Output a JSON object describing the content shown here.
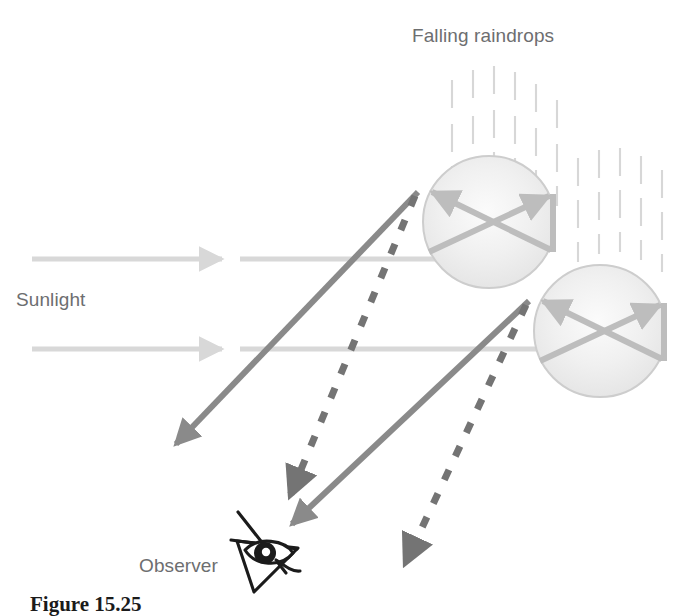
{
  "figure": {
    "type": "physics-ray-diagram",
    "background_color": "#ffffff",
    "caption": "Figure 15.25"
  },
  "labels": {
    "falling_raindrops": "Falling raindrops",
    "sunlight": "Sunlight",
    "observer": "Observer",
    "text_color": "#6d6e70"
  },
  "colors": {
    "incoming_sunlight_ray": "#d8d8d8",
    "internal_ray": "#bfbfbf",
    "exit_ray_solid": "#8a8a8a",
    "exit_ray_dashed": "#747474",
    "raindrop_fill": "#eeeeee",
    "raindrop_stroke": "#cfcfcf",
    "rain_streak": "#d9d9d9",
    "eye_ink": "#1b1b1b"
  },
  "elements": {
    "raindrops": [
      {
        "name": "raindrop-upper",
        "cx": 489,
        "cy": 222,
        "r": 66
      },
      {
        "name": "raindrop-lower",
        "cx": 600,
        "cy": 331,
        "r": 66
      }
    ],
    "incoming_rays": [
      {
        "name": "sunlight-ray-upper",
        "y": 259,
        "x_start": 32,
        "x_end": 228
      },
      {
        "name": "sunlight-ray-lower",
        "y": 349,
        "x_start": 32,
        "x_end": 228
      }
    ],
    "rain_streak_groups": [
      {
        "name": "rain-streaks-upper-left",
        "columns": 6,
        "x_start": 452,
        "x_step": 21,
        "y_top": 66,
        "rows": 3
      },
      {
        "name": "rain-streaks-right",
        "columns": 6,
        "x_start": 570,
        "x_step": 21,
        "y_top": 140,
        "rows": 3
      }
    ],
    "exit_rays_solid": [
      {
        "name": "exit-ray-solid-upper",
        "from": [
          413,
          197
        ],
        "to": [
          172,
          448
        ]
      },
      {
        "name": "exit-ray-solid-lower",
        "from": [
          524,
          306
        ],
        "to": [
          288,
          528
        ]
      }
    ],
    "exit_rays_dashed": [
      {
        "name": "exit-ray-dashed-upper",
        "from": [
          413,
          197
        ],
        "to": [
          289,
          500
        ]
      },
      {
        "name": "exit-ray-dashed-lower",
        "from": [
          524,
          306
        ],
        "to": [
          404,
          568
        ]
      }
    ],
    "observer_eye": {
      "name": "observer-eye-icon",
      "cx": 265,
      "cy": 552
    }
  }
}
